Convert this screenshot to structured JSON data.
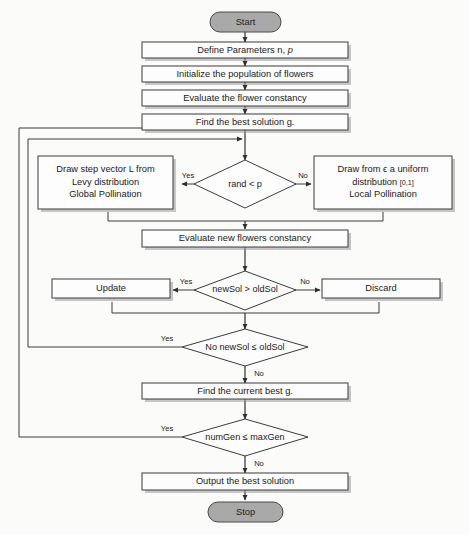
{
  "diagram": {
    "background_color": "#fbfbfa",
    "terminator_fill": "#a9a9a9",
    "box_fill": "#fdfdfd",
    "line_color": "#3b3b3b"
  },
  "nodes": {
    "start": {
      "label": "Start",
      "type": "terminator"
    },
    "define_parameters": {
      "label": "Define Parameters n, p",
      "label_plain": "Define Parameters n, p",
      "type": "process"
    },
    "initialize_population": {
      "label": "Initialize the population of flowers",
      "type": "process"
    },
    "evaluate_constancy": {
      "label": "Evaluate the flower constancy",
      "type": "process"
    },
    "find_best_solution": {
      "label": "Find the best solution g∗",
      "type": "process"
    },
    "global_pollination": {
      "line1": "Draw step vector L from",
      "line2": "Levy distribution",
      "line3": "Global Pollination",
      "type": "process"
    },
    "rand_decision": {
      "label": "rand < p",
      "type": "decision"
    },
    "local_pollination": {
      "line1": "Draw from ϵ a uniform",
      "line2a": "distribution ",
      "line2b": "[0,1]",
      "line3": "Local Pollination",
      "type": "process"
    },
    "evaluate_new_constancy": {
      "label": "Evaluate new flowers constancy",
      "type": "process"
    },
    "update": {
      "label": "Update",
      "type": "process"
    },
    "newsol_decision": {
      "label": "newSol > oldSol",
      "type": "decision"
    },
    "discard": {
      "label": "Discard",
      "type": "process"
    },
    "no_newsol_decision": {
      "label": "No newSol ≤ oldSol",
      "type": "decision"
    },
    "find_current_best": {
      "label": "Find the current best g∗",
      "type": "process"
    },
    "numgen_decision": {
      "label": "numGen ≤ maxGen",
      "type": "decision"
    },
    "output_best": {
      "label": "Output the best solution",
      "type": "process"
    },
    "stop": {
      "label": "Stop",
      "type": "terminator"
    }
  },
  "edge_labels": {
    "rand_yes": "Yes",
    "rand_no": "No",
    "newsol_yes": "Yes",
    "newsol_no": "No",
    "no_newsol_yes": "Yes",
    "no_newsol_no": "No",
    "numgen_yes": "Yes",
    "numgen_no": "No"
  }
}
